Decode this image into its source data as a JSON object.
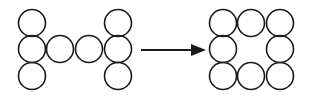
{
  "diagram": {
    "type": "transformation",
    "stroke_color": "#1a1a1a",
    "background": "#ffffff",
    "circle_radius": 13.5,
    "before": {
      "name": "H-shape",
      "circle_count": 8,
      "circles": [
        {
          "cx": 32,
          "cy": 23
        },
        {
          "cx": 32,
          "cy": 49
        },
        {
          "cx": 32,
          "cy": 76
        },
        {
          "cx": 60,
          "cy": 49
        },
        {
          "cx": 89,
          "cy": 49
        },
        {
          "cx": 118,
          "cy": 23
        },
        {
          "cx": 118,
          "cy": 49
        },
        {
          "cx": 118,
          "cy": 76
        }
      ]
    },
    "arrow": {
      "x1": 141,
      "y1": 50,
      "x2": 206,
      "y2": 50,
      "head_length": 15,
      "head_half_width": 6,
      "direction": "right"
    },
    "after": {
      "name": "square-ring",
      "circle_count": 8,
      "circles": [
        {
          "cx": 223,
          "cy": 23
        },
        {
          "cx": 251,
          "cy": 23
        },
        {
          "cx": 280,
          "cy": 23
        },
        {
          "cx": 223,
          "cy": 49
        },
        {
          "cx": 280,
          "cy": 49
        },
        {
          "cx": 223,
          "cy": 76
        },
        {
          "cx": 251,
          "cy": 76
        },
        {
          "cx": 280,
          "cy": 76
        }
      ]
    }
  }
}
